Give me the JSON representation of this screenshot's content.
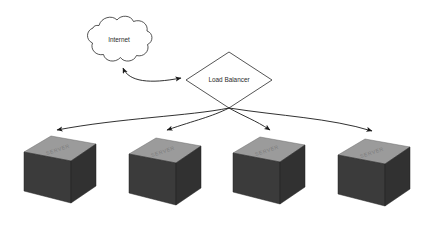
{
  "diagram": {
    "background_color": "#ffffff",
    "line_color": "#1a1a1a",
    "cloud": {
      "label": "Internet",
      "icon": "cloud-icon",
      "fill": "#ffffff",
      "stroke": "#2a2a2a"
    },
    "load_balancer": {
      "label": "Load Balancer",
      "shape": "diamond",
      "fill": "#ffffff",
      "stroke": "#2a2a2a"
    },
    "connector_internet_lb": {
      "type": "double-headed-arrow",
      "from": "Internet",
      "to": "Load Balancer"
    },
    "server_label": "SERVER",
    "server_colors": {
      "top": "#9b9b9b",
      "front": "#3b3b3b",
      "side": "#313131",
      "text": "#7c7c7c"
    },
    "servers": [
      {
        "label": "SERVER",
        "index": "1"
      },
      {
        "label": "SERVER",
        "index": "2"
      },
      {
        "label": "SERVER",
        "index": "3"
      },
      {
        "label": "SERVER",
        "index": "4"
      }
    ],
    "connectors_lb_servers": [
      {
        "type": "arrow",
        "from": "Load Balancer",
        "to": "SERVER"
      },
      {
        "type": "arrow",
        "from": "Load Balancer",
        "to": "SERVER"
      },
      {
        "type": "arrow",
        "from": "Load Balancer",
        "to": "SERVER"
      },
      {
        "type": "arrow",
        "from": "Load Balancer",
        "to": "SERVER"
      }
    ]
  }
}
